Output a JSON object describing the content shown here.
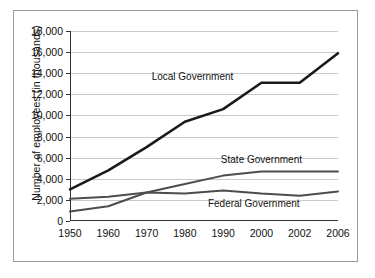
{
  "chart_data": {
    "type": "line",
    "title": "",
    "xlabel": "",
    "ylabel": "Number of employees (in thousands)",
    "x": [
      1950,
      1960,
      1970,
      1980,
      1990,
      2000,
      2002,
      2006
    ],
    "xtick_labels": [
      "1950",
      "1960",
      "1970",
      "1980",
      "1990",
      "2000",
      "2002",
      "2006"
    ],
    "ytick_labels": [
      "0",
      "2,000",
      "4,000",
      "6,000",
      "8,000",
      "10,000",
      "12,000",
      "14,000",
      "16,000",
      "18,000"
    ],
    "ytick_values": [
      0,
      2000,
      4000,
      6000,
      8000,
      10000,
      12000,
      14000,
      16000,
      18000
    ],
    "ylim": [
      0,
      18000
    ],
    "grid": true,
    "legend_position": "inline-annotations",
    "series": [
      {
        "name": "Local Government",
        "color": "#1a1a1a",
        "width": 2.6,
        "values": [
          3000,
          4800,
          7000,
          9400,
          10600,
          13100,
          13100,
          15900
        ],
        "label_x": 1982,
        "label_y": 13700
      },
      {
        "name": "State Government",
        "color": "#4d4d4d",
        "width": 2.0,
        "values": [
          900,
          1400,
          2700,
          3500,
          4300,
          4700,
          4700,
          4700
        ],
        "label_x": 2000,
        "label_y": 5900
      },
      {
        "name": "Federal Government",
        "color": "#4d4d4d",
        "width": 2.0,
        "values": [
          2100,
          2300,
          2700,
          2600,
          2900,
          2600,
          2400,
          2800
        ],
        "label_x": 1998,
        "label_y": 1750
      }
    ]
  }
}
